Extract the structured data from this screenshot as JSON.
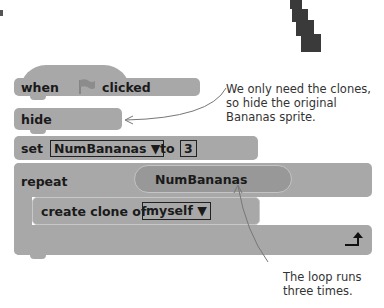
{
  "blocks": {
    "hat": {
      "when": "when",
      "clicked": "clicked",
      "icon": "green-flag-icon"
    },
    "hide": {
      "label": "hide"
    },
    "set": {
      "label": "set",
      "variable": "NumBananas",
      "to": "to",
      "value": "3"
    },
    "repeat": {
      "label": "repeat",
      "count_reporter": "NumBananas"
    },
    "create_clone": {
      "label": "create clone of",
      "target": "myself"
    }
  },
  "annotations": {
    "hide_note": [
      "We only need the clones,",
      "so hide the original",
      "Bananas sprite."
    ],
    "loop_note": [
      "The loop runs",
      "three times."
    ]
  },
  "colors": {
    "block": "#a8a8a8",
    "reporter": "#989898",
    "text": "#1a1a1a",
    "sprite": "#3a3a3a"
  }
}
